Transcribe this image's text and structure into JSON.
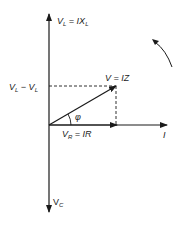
{
  "diagram": {
    "type": "phasor",
    "colors": {
      "stroke": "#1a1a1a",
      "background": "#ffffff"
    },
    "axes": {
      "vertical_top": {
        "main": "V",
        "sub": "L",
        "eq": " = IX",
        "eq_sub": "L"
      },
      "vertical_bottom": {
        "main": "V",
        "sub": "C"
      },
      "horizontal": {
        "label": "I"
      }
    },
    "phasors": {
      "resultant": {
        "label": "V = IZ"
      },
      "resistive": {
        "main": "V",
        "sub": "R",
        "eq": " = IR"
      }
    },
    "projection": {
      "main": "V",
      "sub1": "L",
      "mid": " − V",
      "sub2": "L"
    },
    "angle": {
      "label": "φ"
    },
    "rotation_indicator": {
      "direction": "counterclockwise"
    }
  }
}
